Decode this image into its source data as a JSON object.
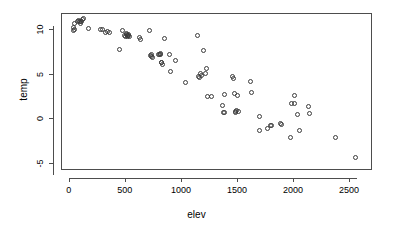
{
  "chart_data": {
    "type": "scatter",
    "title": "",
    "xlabel": "elev",
    "ylabel": "temp",
    "xlim": [
      -70,
      2705
    ],
    "ylim": [
      -5.8,
      11.8
    ],
    "xticks": [
      0,
      500,
      1000,
      1500,
      2000,
      2500
    ],
    "yticks": [
      10,
      5,
      0,
      -5
    ],
    "xtick_labels": [
      "0",
      "500",
      "1000",
      "1500",
      "2000",
      "2500"
    ],
    "ytick_labels": [
      "10",
      "5",
      "0",
      "-5"
    ],
    "grid": false,
    "legend": null,
    "marker": "open-circle",
    "marker_color": "#3c3c3c",
    "frame": true,
    "n_points": 86,
    "x": [
      40,
      45,
      48,
      52,
      75,
      85,
      95,
      100,
      105,
      115,
      125,
      130,
      175,
      280,
      300,
      330,
      345,
      360,
      450,
      480,
      500,
      505,
      510,
      515,
      520,
      525,
      530,
      535,
      545,
      630,
      640,
      720,
      730,
      735,
      740,
      745,
      800,
      810,
      815,
      820,
      825,
      830,
      835,
      850,
      900,
      910,
      955,
      1040,
      1150,
      1160,
      1165,
      1175,
      1185,
      1200,
      1215,
      1225,
      1240,
      1275,
      1370,
      1380,
      1385,
      1390,
      1460,
      1470,
      1480,
      1485,
      1490,
      1495,
      1505,
      1515,
      1620,
      1630,
      1700,
      1705,
      1775,
      1800,
      1810,
      1890,
      1900,
      1975,
      1985,
      2010,
      2015,
      2040,
      2055,
      2140,
      2150,
      2380,
      2560
    ],
    "y": [
      9.8,
      10.2,
      10.6,
      10.0,
      10.8,
      11.0,
      10.9,
      10.6,
      10.8,
      10.9,
      11.1,
      11.2,
      10.1,
      10.0,
      9.9,
      9.6,
      9.7,
      9.6,
      7.7,
      9.8,
      9.3,
      9.2,
      9.5,
      9.4,
      9.3,
      9.2,
      9.4,
      9.3,
      9.2,
      9.0,
      8.8,
      9.8,
      7.0,
      6.9,
      7.1,
      6.8,
      7.2,
      7.1,
      7.3,
      7.2,
      6.3,
      6.2,
      6.0,
      8.9,
      7.1,
      5.2,
      6.5,
      4.0,
      9.3,
      4.7,
      4.6,
      5.0,
      4.8,
      7.6,
      5.0,
      5.6,
      2.4,
      2.4,
      1.4,
      0.7,
      0.6,
      2.7,
      4.7,
      4.5,
      2.8,
      0.8,
      0.7,
      0.9,
      2.5,
      0.8,
      4.1,
      2.9,
      -1.4,
      0.2,
      -1.1,
      -0.8,
      -0.8,
      -0.6,
      -0.7,
      -2.2,
      1.7,
      2.5,
      1.6,
      0.4,
      -1.4,
      1.3,
      0.5,
      -2.2,
      -4.4
    ]
  },
  "axes": {
    "x_title": "elev",
    "y_title": "temp"
  }
}
